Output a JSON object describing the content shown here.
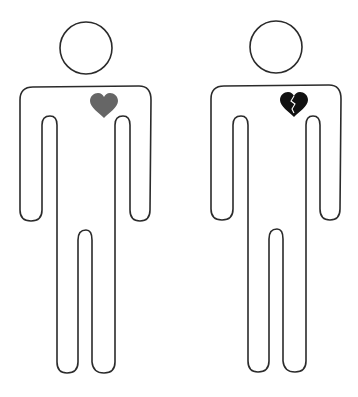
{
  "scene": {
    "description": "Two stick-figure outlines side by side, one with an intact heart and one with a broken heart",
    "background_color": "#ffffff",
    "outline_color": "#2b2b2b"
  },
  "figures": [
    {
      "id": "left",
      "label": "Person with whole heart",
      "heart": {
        "icon": "heart-icon",
        "state": "whole",
        "color": "#666666"
      }
    },
    {
      "id": "right",
      "label": "Person with broken heart",
      "heart": {
        "icon": "broken-heart-icon",
        "state": "broken",
        "color": "#111111"
      }
    }
  ]
}
